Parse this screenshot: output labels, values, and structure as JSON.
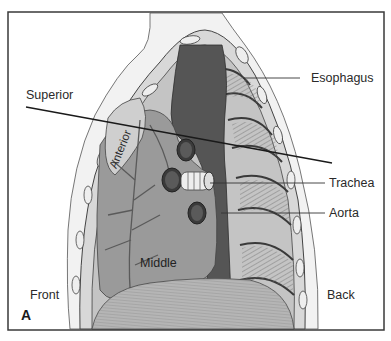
{
  "figure": {
    "panel_letter": "A",
    "labels": {
      "superior": "Superior",
      "anterior": "Anterior",
      "middle": "Middle",
      "front": "Front",
      "back": "Back",
      "esophagus": "Esophagus",
      "trachea": "Trachea",
      "aorta": "Aorta"
    },
    "colors": {
      "frame": "#3a3a3a",
      "background": "#ffffff",
      "skin": "#f2f2f2",
      "lung_fill": "#a9a9a9",
      "heart_fill": "#9a9a9a",
      "vessel_dark": "#555555",
      "ribs": "#c8c8c8",
      "diaphragm": "#b5b5b5"
    }
  }
}
